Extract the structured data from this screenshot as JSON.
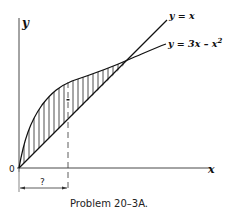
{
  "figure": {
    "axis_x_label": "x",
    "axis_y_label": "y",
    "origin_label": "0",
    "curves": [
      {
        "name": "line",
        "label": "y = x"
      },
      {
        "name": "parabola",
        "label": "y = 3x – x",
        "label_sup": "2"
      }
    ],
    "dimension_label": "?",
    "caption": "Problem 20–3A."
  },
  "colors": {
    "ink": "#111111",
    "background": "#ffffff"
  }
}
